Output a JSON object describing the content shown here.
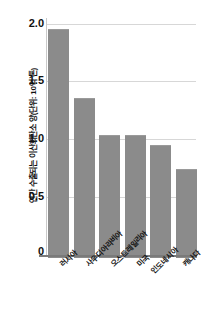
{
  "chart_data": {
    "type": "bar",
    "title": "",
    "subtitle": "",
    "xlabel": "",
    "ylabel": "연간 수출되는 이산화탄소 양(단위: 10억 톤)",
    "categories": [
      "러시아",
      "사우디아라비아",
      "오스트레일리아",
      "미국",
      "인도네시아",
      "캐나다"
    ],
    "values": [
      1.96,
      1.37,
      1.05,
      1.05,
      0.97,
      0.76
    ],
    "series": [
      {
        "name": "연간 수출되는 이산화탄소 양",
        "values": [
          1.96,
          1.37,
          1.05,
          1.05,
          0.97,
          0.76
        ]
      }
    ],
    "ylim": [
      0,
      2.0
    ],
    "yticks": [
      0,
      0.5,
      1.0,
      1.5,
      2.0
    ],
    "ytick_labels": [
      "0",
      "0.5",
      "1.0",
      "1.5",
      "2.0"
    ],
    "grid": true,
    "legend": false,
    "bar_color": "#8b8b8b",
    "gridline_color": "#d7d7d7",
    "axis_color": "#7a7a7a"
  },
  "axis": {
    "y_title": "연간 수출되는 이산화탄소 양(단위: 10억 톤)",
    "ticks": {
      "t0": "0",
      "t1": "0.5",
      "t2": "1.0",
      "t3": "1.5",
      "t4": "2.0"
    }
  },
  "bars": {
    "b0": {
      "label": "러시아",
      "value": "1.96"
    },
    "b1": {
      "label": "사우디아라비아",
      "value": "1.37"
    },
    "b2": {
      "label": "오스트레일리아",
      "value": "1.05"
    },
    "b3": {
      "label": "미국",
      "value": "1.05"
    },
    "b4": {
      "label": "인도네시아",
      "value": "0.97"
    },
    "b5": {
      "label": "캐나다",
      "value": "0.76"
    }
  }
}
